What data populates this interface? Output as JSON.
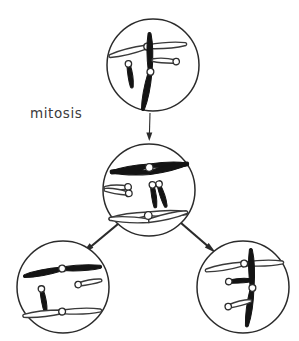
{
  "figure": {
    "title": "mitosis",
    "background_color": "#ffffff",
    "width": 299,
    "height": 341
  },
  "labels": [
    {
      "name": "mitosis-label",
      "text": "mitosis",
      "x": 30,
      "y": 105,
      "color": "#3c3c3c"
    }
  ],
  "colors": {
    "outline": "#2b2b2b",
    "dark_chromosome": "#141414",
    "light_chromosome_fill": "#ffffff",
    "light_chromosome_stroke": "#3a3a3a",
    "centromere_fill": "#ffffff",
    "text": "#3c3c3c"
  },
  "cells": [
    {
      "name": "parent-cell",
      "role": "parent",
      "label": "parent cell",
      "cx": 153,
      "cy": 65,
      "r": 46,
      "chromosome_count": 4,
      "duplicated": false,
      "chromosomes": [
        {
          "name": "long-light-chromosome",
          "shade": "light",
          "size": "long",
          "form": "single",
          "cx": 147,
          "cy": 45,
          "rotation": -8
        },
        {
          "name": "short-dark-chromosome",
          "shade": "dark",
          "size": "short",
          "form": "single",
          "cx": 130,
          "cy": 64,
          "rotation": 4
        },
        {
          "name": "long-dark-chromosome",
          "shade": "dark",
          "size": "long",
          "form": "single",
          "cx": 152,
          "cy": 72,
          "rotation": 96
        },
        {
          "name": "short-light-chromosome",
          "shade": "light",
          "size": "short",
          "form": "single",
          "cx": 176,
          "cy": 60,
          "rotation": -8
        }
      ]
    },
    {
      "name": "metaphase-cell",
      "role": "dividing",
      "label": "cell with duplicated chromosomes",
      "cx": 149,
      "cy": 190,
      "r": 46,
      "chromosome_count": 4,
      "duplicated": true,
      "chromosomes": [
        {
          "name": "long-dark-duplicated-chromosome",
          "shade": "dark",
          "size": "long",
          "form": "duplicated",
          "cx": 149,
          "cy": 164,
          "rotation": -4
        },
        {
          "name": "short-light-duplicated-chromosome",
          "shade": "light",
          "size": "short",
          "form": "duplicated",
          "cx": 124,
          "cy": 186,
          "rotation": -4
        },
        {
          "name": "short-dark-duplicated-chromosome",
          "shade": "dark",
          "size": "short",
          "form": "duplicated",
          "cx": 160,
          "cy": 184,
          "rotation": 86
        },
        {
          "name": "long-light-duplicated-chromosome",
          "shade": "light",
          "size": "long",
          "form": "duplicated",
          "cx": 148,
          "cy": 212,
          "rotation": -4
        }
      ]
    },
    {
      "name": "daughter-cell-left",
      "role": "daughter",
      "label": "daughter cell",
      "cx": 63,
      "cy": 287,
      "r": 46,
      "chromosome_count": 4,
      "duplicated": false,
      "chromosomes": [
        {
          "name": "long-dark-chromosome",
          "shade": "dark",
          "size": "long",
          "form": "single",
          "cx": 62,
          "cy": 267,
          "rotation": -6
        },
        {
          "name": "short-dark-chromosome",
          "shade": "dark",
          "size": "short",
          "form": "single",
          "cx": 43,
          "cy": 289,
          "rotation": 92
        },
        {
          "name": "short-light-chromosome",
          "shade": "light",
          "size": "short",
          "form": "single",
          "cx": 78,
          "cy": 283,
          "rotation": -4
        },
        {
          "name": "long-light-chromosome",
          "shade": "light",
          "size": "long",
          "form": "single",
          "cx": 62,
          "cy": 310,
          "rotation": -4
        }
      ]
    },
    {
      "name": "daughter-cell-right",
      "role": "daughter",
      "label": "daughter cell",
      "cx": 243,
      "cy": 287,
      "r": 46,
      "chromosome_count": 4,
      "duplicated": false,
      "chromosomes": [
        {
          "name": "long-light-chromosome",
          "shade": "light",
          "size": "long",
          "form": "single",
          "cx": 244,
          "cy": 262,
          "rotation": -6
        },
        {
          "name": "short-dark-chromosome",
          "shade": "dark",
          "size": "short",
          "form": "single",
          "cx": 229,
          "cy": 280,
          "rotation": 8
        },
        {
          "name": "long-dark-chromosome",
          "shade": "dark",
          "size": "long",
          "form": "single",
          "cx": 254,
          "cy": 288,
          "rotation": 94
        },
        {
          "name": "short-light-chromosome",
          "shade": "light",
          "size": "short",
          "form": "single",
          "cx": 228,
          "cy": 305,
          "rotation": -8
        }
      ]
    }
  ],
  "arrows": [
    {
      "name": "arrow-parent-to-metaphase",
      "from": "parent-cell",
      "to": "metaphase-cell",
      "x1": 150,
      "y1": 113,
      "x2": 149,
      "y2": 141,
      "width": 1.1,
      "head_size": 5
    },
    {
      "name": "arrow-metaphase-to-left-daughter",
      "from": "metaphase-cell",
      "to": "daughter-cell-left",
      "x1": 118,
      "y1": 224,
      "x2": 82,
      "y2": 254,
      "width": 2.2,
      "head_size": 7
    },
    {
      "name": "arrow-metaphase-to-right-daughter",
      "from": "metaphase-cell",
      "to": "daughter-cell-right",
      "x1": 181,
      "y1": 223,
      "x2": 216,
      "y2": 253,
      "width": 2.2,
      "head_size": 7
    }
  ]
}
